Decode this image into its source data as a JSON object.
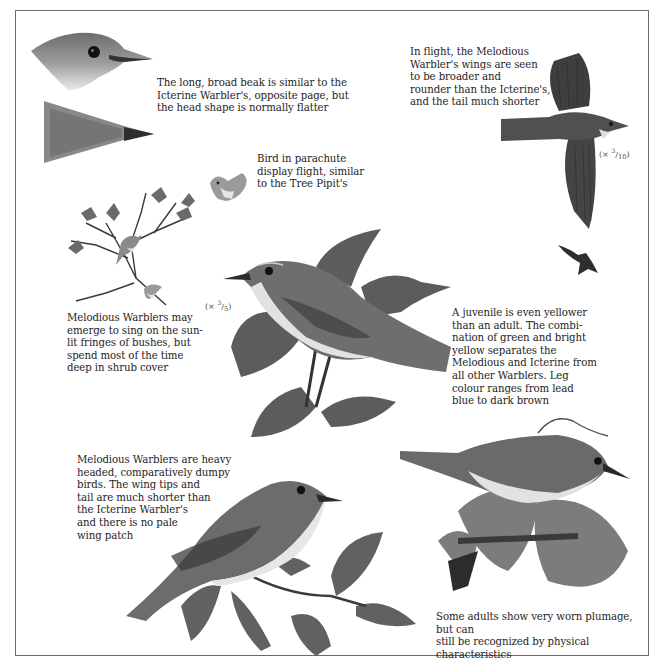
{
  "page": {
    "subject": "Melodious Warbler",
    "captions": {
      "beak": "The long, broad beak is similar to the\nIcterine Warbler's, opposite page, but\nthe head shape is normally flatter",
      "flight": "In flight, the Melodious\nWarbler's wings are seen\nto be broader and\nrounder than the Icterine's,\nand the tail much shorter",
      "parachute": "Bird in parachute\ndisplay flight, similar\nto the Tree Pipit's",
      "singing": "Melodious Warblers may\nemerge to sing on the sun-\nlit fringes of bushes, but\nspend most of the time\ndeep in shrub cover",
      "juvenile": "A juvenile is even yellower\nthan an adult. The combi-\nnation of green and bright\nyellow separates the\nMelodious and Icterine from\nall other Warblers. Leg\ncolour ranges from lead\nblue to dark brown",
      "heavy": "Melodious Warblers are heavy\nheaded, comparatively dumpy\nbirds. The wing tips and\ntail are much shorter than\nthe Icterine Warbler's\nand there is no pale\nwing patch",
      "worn": "Some adults show very worn plumage, but can\nstill be recognized by physical characteristics"
    },
    "scales": {
      "flight": {
        "prefix": "(× ",
        "num": "3",
        "den": "10",
        "suffix": ")"
      },
      "main": {
        "prefix": "(× ",
        "num": "3",
        "den": "5",
        "suffix": ")"
      }
    },
    "colors": {
      "border": "#6a6a6a",
      "text": "#1e1e1e",
      "plumage_dark": "#4a4a4a",
      "plumage_mid": "#7a7a7a",
      "underparts": "#e4e4e4",
      "leaf": "#5c5c5c"
    }
  }
}
